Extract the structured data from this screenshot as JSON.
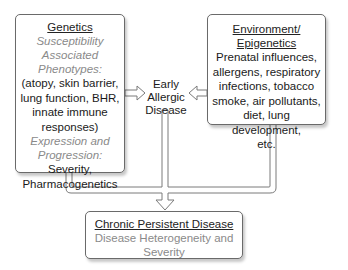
{
  "diagram": {
    "genetics": {
      "title": "Genetics",
      "subtitle1": "Susceptibility",
      "subtitle2": "Associated",
      "subtitle3": "Phenotypes:",
      "body_lines": [
        "(atopy, skin barrier,",
        "lung function, BHR,",
        "innate immune",
        "responses)"
      ],
      "subtitle4": "Expression and",
      "subtitle5": "Progression:",
      "footer_lines": [
        "Severity,",
        "Pharmacogenetics"
      ]
    },
    "environment": {
      "title_line1": "Environment/",
      "title_line2": "Epigenetics",
      "body_lines": [
        "Prenatal influences,",
        "allergens, respiratory",
        "infections, tobacco",
        "smoke, air pollutants,",
        "diet, lung development,",
        "etc."
      ]
    },
    "early_allergic": {
      "lines": [
        "Early",
        "Allergic",
        "Disease"
      ]
    },
    "chronic": {
      "title": "Chronic Persistent Disease",
      "body_lines": [
        "Disease Heterogeneity and",
        "Severity"
      ]
    },
    "colors": {
      "border": "#6a6a6a",
      "subtitle_gray": "#8a8a8a",
      "text": "#1a1a1a",
      "arrow_fill": "#ffffff",
      "arrow_stroke": "#7a7a7a"
    }
  }
}
